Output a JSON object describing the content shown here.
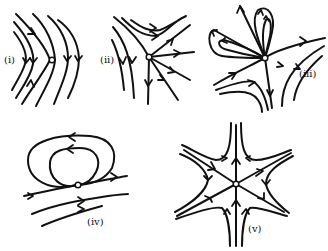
{
  "figure": {
    "panels": [
      {
        "id": "i",
        "label": "(i)",
        "description": "parallel flow field with a fixed point; trajectories bend downward (chevron shape)"
      },
      {
        "id": "ii",
        "label": "(ii)",
        "description": "fixed point with trajectories emanating outward in a fan and flowing downward on the left"
      },
      {
        "id": "iii",
        "label": "(iii)",
        "description": "fixed point with several homoclinic loops (petals) and incoming/outgoing flow lines"
      },
      {
        "id": "iv",
        "label": "(iv)",
        "description": "fixed point with nested closed loops above and horizontal flow lines below, flowing right"
      },
      {
        "id": "v",
        "label": "(v)",
        "description": "six-sector fixed point with separatrices and hyperbolic sectors between them (star shape)"
      }
    ],
    "colors": {
      "stroke": "#111111",
      "background": "#ffffff"
    }
  }
}
